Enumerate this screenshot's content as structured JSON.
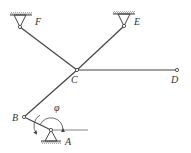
{
  "diagram": {
    "type": "linkage mechanism",
    "labels": {
      "A": "A",
      "B": "B",
      "C": "C",
      "D": "D",
      "E": "E",
      "F": "F",
      "angle": "φ"
    },
    "colors": {
      "line": "#444444",
      "background": "#ffffff"
    }
  }
}
